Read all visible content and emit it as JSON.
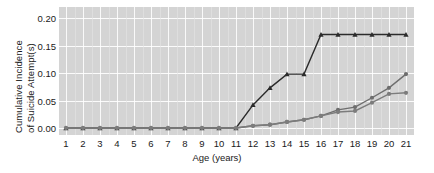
{
  "chart_data": {
    "type": "line",
    "title": "",
    "xlabel": "Age (years)",
    "ylabel_line1": "Cumulative Incidence",
    "ylabel_line2": "of Suicide Attempt(s)",
    "x": [
      1,
      2,
      3,
      4,
      5,
      6,
      7,
      8,
      9,
      10,
      11,
      12,
      13,
      14,
      15,
      16,
      17,
      18,
      19,
      20,
      21
    ],
    "xlim": [
      1,
      21
    ],
    "ylim": [
      0.0,
      0.21
    ],
    "yticks": [
      0.0,
      0.05,
      0.1,
      0.15,
      0.2
    ],
    "ytick_labels": [
      "0.00",
      "0.05",
      "0.10",
      "0.15",
      "0.20"
    ],
    "xtick_labels": [
      "1",
      "2",
      "3",
      "4",
      "5",
      "6",
      "7",
      "8",
      "9",
      "10",
      "11",
      "12",
      "13",
      "14",
      "15",
      "16",
      "17",
      "18",
      "19",
      "20",
      "21"
    ],
    "grid": true,
    "grid_color": "#ffffff",
    "panel_background": "#d4d4d4",
    "legend": "none",
    "series": [
      {
        "name": "series-dark-triangle",
        "marker": "triangle",
        "color": "#2b2b2b",
        "values": [
          0.0,
          0.0,
          0.0,
          0.0,
          0.0,
          0.0,
          0.0,
          0.0,
          0.0,
          0.0,
          0.0,
          0.042,
          0.073,
          0.098,
          0.098,
          0.17,
          0.17,
          0.17,
          0.17,
          0.17,
          0.17
        ]
      },
      {
        "name": "series-gray-circle-upper",
        "marker": "circle",
        "color": "#6e6e6e",
        "values": [
          0.0,
          0.0,
          0.0,
          0.0,
          0.0,
          0.0,
          0.0,
          0.0,
          0.0,
          0.0,
          0.0,
          0.004,
          0.006,
          0.011,
          0.015,
          0.022,
          0.033,
          0.038,
          0.055,
          0.073,
          0.098
        ]
      },
      {
        "name": "series-gray-circle-lower",
        "marker": "circle",
        "color": "#7c7c7c",
        "values": [
          0.0,
          0.0,
          0.0,
          0.0,
          0.0,
          0.0,
          0.0,
          0.0,
          0.0,
          0.0,
          0.0,
          0.004,
          0.006,
          0.011,
          0.015,
          0.022,
          0.029,
          0.031,
          0.046,
          0.062,
          0.064
        ]
      }
    ]
  }
}
